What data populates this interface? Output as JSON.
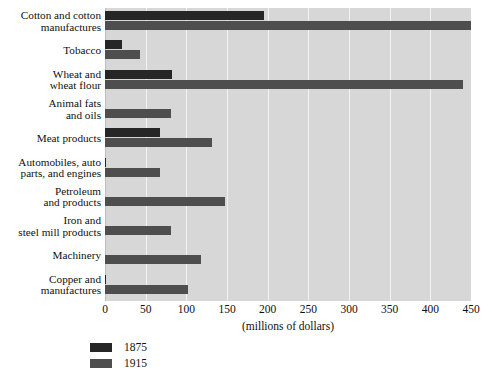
{
  "chart_data": {
    "type": "bar",
    "orientation": "horizontal",
    "title": "",
    "xlabel": "(millions of dollars)",
    "ylabel": "",
    "xlim": [
      0,
      450
    ],
    "xticks": [
      0,
      50,
      100,
      150,
      200,
      250,
      300,
      350,
      400,
      450
    ],
    "xtick_labels": [
      "0",
      "50",
      "100",
      "150",
      "200",
      "250",
      "300",
      "350",
      "400",
      "450"
    ],
    "grid": true,
    "legend_position": "bottom-left",
    "categories": [
      "Cotton and cotton manufactures",
      "Tobacco",
      "Wheat and wheat flour",
      "Animal fats and oils",
      "Meat products",
      "Automobiles, auto parts, and engines",
      "Petroleum and products",
      "Iron and steel mill products",
      "Machinery",
      "Copper and manufactures"
    ],
    "category_lines": [
      [
        "Cotton and cotton",
        "manufactures"
      ],
      [
        "Tobacco"
      ],
      [
        "Wheat and",
        "wheat flour"
      ],
      [
        "Animal fats",
        "and oils"
      ],
      [
        "Meat products"
      ],
      [
        "Automobiles, auto",
        "parts, and engines"
      ],
      [
        "Petroleum",
        "and products"
      ],
      [
        "Iron and",
        "steel mill products"
      ],
      [
        "Machinery"
      ],
      [
        "Copper and",
        "manufactures"
      ]
    ],
    "series": [
      {
        "name": "1875",
        "color": "#262626",
        "values": [
          196,
          21,
          82,
          0,
          68,
          1,
          0,
          0,
          0,
          1
        ]
      },
      {
        "name": "1915",
        "color": "#4e4e4e",
        "values": [
          450,
          43,
          440,
          81,
          132,
          68,
          147,
          81,
          118,
          102
        ]
      }
    ]
  },
  "legend": {
    "items": [
      {
        "label": "1875",
        "color": "#262626"
      },
      {
        "label": "1915",
        "color": "#4e4e4e"
      }
    ]
  },
  "axis": {
    "caption": "(millions of dollars)"
  },
  "source_note": ""
}
